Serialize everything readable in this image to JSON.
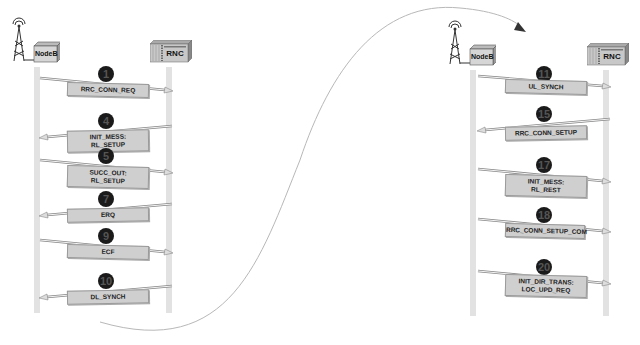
{
  "diagram": {
    "type": "message-sequence",
    "panels": [
      {
        "name": "left-panel",
        "entities": [
          {
            "label": "NodeB",
            "icon": "nodeb-tower-icon"
          },
          {
            "label": "RNC",
            "icon": "rnc-rack-icon"
          }
        ],
        "messages": [
          {
            "step": "1",
            "lines": [
              "RRC_CONN_REQ"
            ],
            "direction": "right"
          },
          {
            "step": "4",
            "lines": [
              "INIT_MESS:",
              "RL_SETUP"
            ],
            "direction": "left"
          },
          {
            "step": "5",
            "lines": [
              "SUCC_OUT:",
              "RL_SETUP"
            ],
            "direction": "right"
          },
          {
            "step": "7",
            "lines": [
              "ERQ"
            ],
            "direction": "left"
          },
          {
            "step": "9",
            "lines": [
              "ECF"
            ],
            "direction": "right"
          },
          {
            "step": "10",
            "lines": [
              "DL_SYNCH"
            ],
            "direction": "left"
          }
        ]
      },
      {
        "name": "right-panel",
        "entities": [
          {
            "label": "NodeB",
            "icon": "nodeb-tower-icon"
          },
          {
            "label": "RNC",
            "icon": "rnc-rack-icon"
          }
        ],
        "messages": [
          {
            "step": "11",
            "lines": [
              "UL_SYNCH"
            ],
            "direction": "right"
          },
          {
            "step": "15",
            "lines": [
              "RRC_CONN_SETUP"
            ],
            "direction": "left"
          },
          {
            "step": "17",
            "lines": [
              "INIT_MESS:",
              "RL_REST"
            ],
            "direction": "right"
          },
          {
            "step": "18",
            "lines": [
              "RRC_CONN_SETUP_COM"
            ],
            "direction": "right"
          },
          {
            "step": "20",
            "lines": [
              "INIT_DIR_TRANS:",
              "LOC_UPD_REQ"
            ],
            "direction": "right"
          }
        ]
      }
    ],
    "connector": {
      "from": "left-panel-end",
      "to": "right-panel-start",
      "style": "curved-arrow"
    }
  },
  "colors": {
    "lifeline": "#e2e2e2",
    "label_box": "#cfcfcf",
    "badge": "#1a1a1a",
    "connector": "#b0b0b0"
  }
}
